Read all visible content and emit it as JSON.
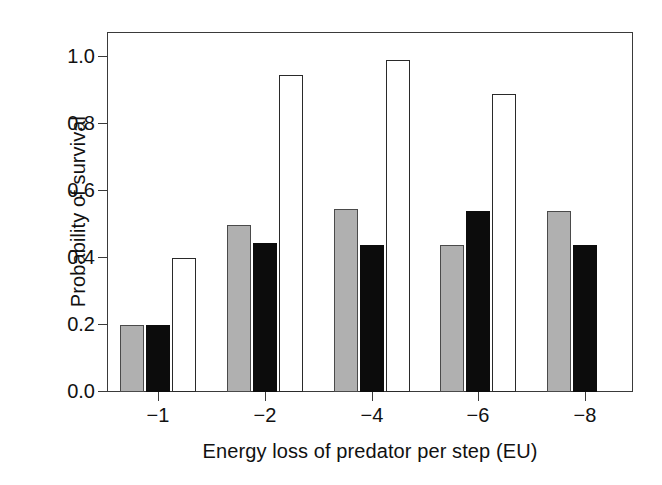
{
  "chart_data": {
    "type": "bar",
    "title": "",
    "subtitle": "",
    "xlabel": "Energy loss of predator per step (EU)",
    "ylabel": "Probability of survival",
    "categories": [
      "−1",
      "−2",
      "−4",
      "−6",
      "−8"
    ],
    "xtick_labels": [
      "−1",
      "−2",
      "−4",
      "−6",
      "−8"
    ],
    "ytick_labels": [
      "0.0",
      "0.2",
      "0.4",
      "0.6",
      "0.8",
      "1.0"
    ],
    "ytick_values": [
      0.0,
      0.2,
      0.4,
      0.6,
      0.8,
      1.0
    ],
    "ylim": [
      0.0,
      1.1
    ],
    "xlim_note": "categorical, 5 groups",
    "grid": false,
    "legend": "none",
    "series": [
      {
        "name": "grey",
        "fill": "#b0b0b0",
        "edge": "#4a4a4a",
        "values": [
          0.2,
          0.5,
          0.545,
          0.44,
          0.54
        ]
      },
      {
        "name": "black",
        "fill": "#0c0c0c",
        "edge": "#0c0c0c",
        "values": [
          0.2,
          0.445,
          0.44,
          0.54,
          0.44
        ]
      },
      {
        "name": "white",
        "fill": "#ffffff",
        "edge": "#2a2a2a",
        "values": [
          0.4,
          0.945,
          0.99,
          0.89,
          null
        ]
      }
    ],
    "annotations": []
  },
  "axes": {
    "y_title": "Probability of survival",
    "x_title": "Energy loss of predator per step (EU)",
    "y_labels": [
      "1.0",
      "0.8",
      "0.6",
      "0.4",
      "0.2",
      "0.0"
    ],
    "x_labels": [
      "−1",
      "−2",
      "−4",
      "−6",
      "−8"
    ]
  },
  "colors": {
    "grey_bar": "#b0b0b0",
    "black_bar": "#0c0c0c",
    "white_bar": "#ffffff",
    "axis": "#3a3a3a",
    "text": "#111111",
    "background": "#ffffff"
  }
}
